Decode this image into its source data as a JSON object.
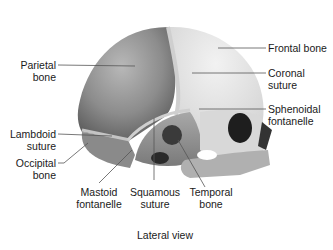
{
  "figure": {
    "caption": "Lateral view",
    "labels": {
      "parietal_bone": [
        "Parietal",
        "bone"
      ],
      "frontal_bone": [
        "Frontal bone"
      ],
      "coronal_suture": [
        "Coronal",
        "suture"
      ],
      "sphenoidal_fontanelle": [
        "Sphenoidal",
        "fontanelle"
      ],
      "lambdoid_suture": [
        "Lambdoid",
        "suture"
      ],
      "occipital_bone": [
        "Occipital",
        "bone"
      ],
      "mastoid_fontanelle": [
        "Mastoid",
        "fontanelle"
      ],
      "squamous_suture": [
        "Squamous",
        "suture"
      ],
      "temporal_bone": [
        "Temporal",
        "bone"
      ]
    },
    "colors": {
      "parietal": "#8a8a8a",
      "frontal": "#e6e6e6",
      "suture": "#c8c8c8",
      "orbit": "#1e1e1e",
      "leader": "#555555"
    }
  }
}
